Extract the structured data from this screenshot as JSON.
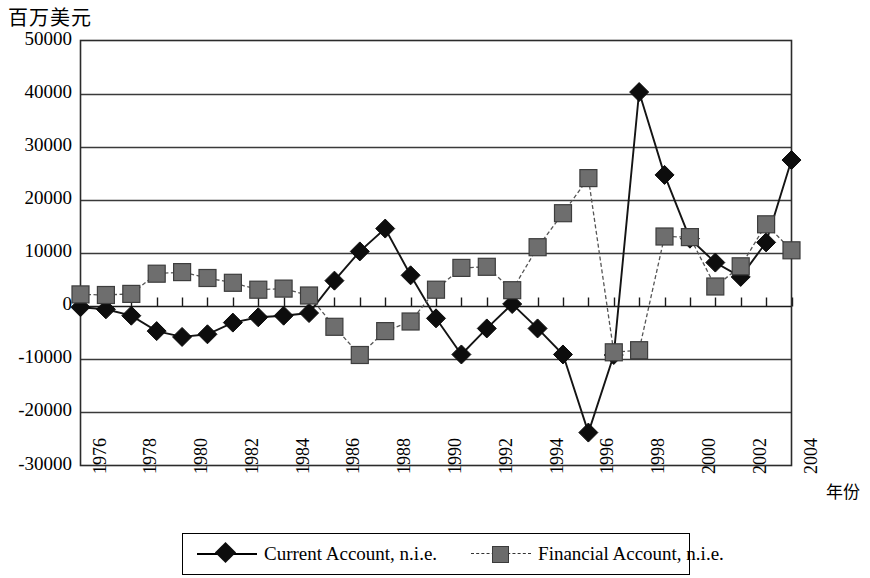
{
  "chart_data": {
    "type": "line",
    "title": "",
    "ylabel": "百万美元",
    "xlabel": "年份",
    "ylim": [
      -30000,
      50000
    ],
    "ytick_values": [
      50000,
      40000,
      30000,
      20000,
      10000,
      0,
      -10000,
      -20000,
      -30000
    ],
    "ytick_labels": [
      "50000",
      "40000",
      "30000",
      "20000",
      "10000",
      "0",
      "-10000",
      "-20000",
      "-30000"
    ],
    "grid": true,
    "legend_position": "bottom",
    "x": [
      1976,
      1977,
      1978,
      1979,
      1980,
      1981,
      1982,
      1983,
      1984,
      1985,
      1986,
      1987,
      1988,
      1989,
      1990,
      1991,
      1992,
      1993,
      1994,
      1995,
      1996,
      1997,
      1998,
      1999,
      2000,
      2001,
      2002,
      2003,
      2004
    ],
    "xtick_labels": [
      "1976",
      "1978",
      "1980",
      "1982",
      "1984",
      "1986",
      "1988",
      "1990",
      "1992",
      "1994",
      "1996",
      "1998",
      "2000",
      "2002",
      "2004"
    ],
    "xtick_values": [
      1976,
      1978,
      1980,
      1982,
      1984,
      1986,
      1988,
      1990,
      1992,
      1994,
      1996,
      1998,
      2000,
      2002,
      2004
    ],
    "series": [
      {
        "name": "Current Account, n.i.e.",
        "marker": "diamond",
        "color": "#0d0d0d",
        "values": [
          -200,
          -600,
          -1800,
          -4700,
          -5800,
          -5300,
          -3100,
          -2100,
          -1800,
          -1300,
          4800,
          10300,
          14600,
          5800,
          -2300,
          -9100,
          -4200,
          400,
          -4200,
          -9100,
          -23800,
          -9200,
          40300,
          24700,
          12700,
          8200,
          5500,
          12000,
          27500
        ]
      },
      {
        "name": "Financial Account, n.i.e.",
        "marker": "square",
        "color": "#6b6b6b",
        "values": [
          2200,
          2100,
          2300,
          6100,
          6400,
          5300,
          4400,
          3100,
          3300,
          2000,
          -3900,
          -9200,
          -4700,
          -2900,
          3100,
          7200,
          7400,
          3000,
          11100,
          17500,
          24100,
          -8700,
          -8300,
          13100,
          13000,
          3700,
          7500,
          15400,
          10500
        ]
      }
    ]
  },
  "legend": {
    "items": [
      {
        "label": "Current Account, n.i.e.",
        "marker": "diamond-marker"
      },
      {
        "label": "Financial Account, n.i.e.",
        "marker": "square-marker"
      }
    ]
  },
  "axes": {
    "y_title": "百万美元",
    "x_title": "年份"
  }
}
